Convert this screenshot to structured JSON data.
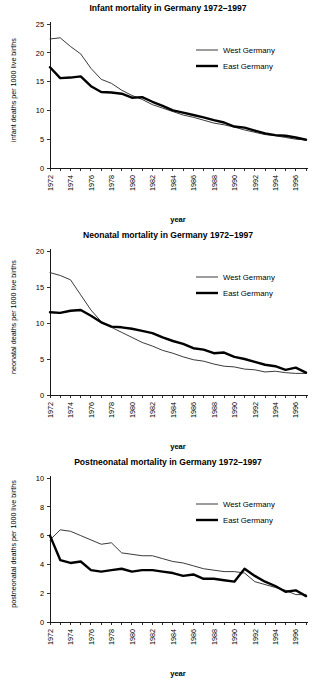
{
  "figure": {
    "panel_count": 3,
    "xlabel": "year",
    "legend": {
      "west_label": "West Germany",
      "east_label": "East Germany",
      "west_color": "#3a3a3a",
      "east_color": "#000000"
    }
  },
  "chart_data": [
    {
      "type": "line",
      "title": "Infant mortality in Germany 1972–1997",
      "xlabel": "year",
      "ylabel": "infant deaths per 1000 live births",
      "ylim": [
        0,
        25
      ],
      "yticks": [
        0,
        5,
        10,
        15,
        20,
        25
      ],
      "xlim": [
        1972,
        1997
      ],
      "xticks": [
        1972,
        1973,
        1974,
        1975,
        1976,
        1977,
        1978,
        1979,
        1980,
        1981,
        1982,
        1983,
        1984,
        1985,
        1986,
        1987,
        1988,
        1989,
        1990,
        1991,
        1992,
        1993,
        1994,
        1995,
        1996,
        1997
      ],
      "xticklabels": [
        "1972",
        "",
        "1974",
        "",
        "1976",
        "",
        "1978",
        "",
        "1980",
        "",
        "1982",
        "",
        "1984",
        "",
        "1986",
        "",
        "1988",
        "",
        "1990",
        "",
        "1992",
        "",
        "1994",
        "",
        "1996",
        ""
      ],
      "grid": false,
      "legend_position": "upper right",
      "x": [
        1972,
        1973,
        1974,
        1975,
        1976,
        1977,
        1978,
        1979,
        1980,
        1981,
        1982,
        1983,
        1984,
        1985,
        1986,
        1987,
        1988,
        1989,
        1990,
        1991,
        1992,
        1993,
        1994,
        1995,
        1996,
        1997
      ],
      "series": [
        {
          "name": "West Germany",
          "values": [
            22.4,
            22.6,
            21.1,
            19.8,
            17.3,
            15.4,
            14.7,
            13.5,
            12.6,
            11.9,
            11.0,
            10.4,
            9.8,
            9.2,
            8.8,
            8.3,
            7.8,
            7.5,
            7.1,
            6.6,
            6.2,
            5.8,
            5.6,
            5.3,
            5.0,
            4.9
          ]
        },
        {
          "name": "East Germany",
          "values": [
            17.5,
            15.6,
            15.7,
            15.9,
            14.2,
            13.2,
            13.1,
            12.9,
            12.2,
            12.3,
            11.5,
            10.8,
            10.0,
            9.6,
            9.2,
            8.8,
            8.3,
            7.9,
            7.2,
            7.0,
            6.5,
            6.0,
            5.7,
            5.6,
            5.3,
            4.9
          ]
        }
      ]
    },
    {
      "type": "line",
      "title": "Neonatal mortality in Germany 1972–1997",
      "xlabel": "year",
      "ylabel": "neonatal deaths per 1000 live births",
      "ylim": [
        0,
        20
      ],
      "yticks": [
        0,
        5,
        10,
        15,
        20
      ],
      "xlim": [
        1972,
        1997
      ],
      "xticks": [
        1972,
        1973,
        1974,
        1975,
        1976,
        1977,
        1978,
        1979,
        1980,
        1981,
        1982,
        1983,
        1984,
        1985,
        1986,
        1987,
        1988,
        1989,
        1990,
        1991,
        1992,
        1993,
        1994,
        1995,
        1996,
        1997
      ],
      "xticklabels": [
        "1972",
        "",
        "1974",
        "",
        "1976",
        "",
        "1978",
        "",
        "1980",
        "",
        "1982",
        "",
        "1984",
        "",
        "1986",
        "",
        "1988",
        "",
        "1990",
        "",
        "1992",
        "",
        "1994",
        "",
        "1996",
        ""
      ],
      "grid": false,
      "legend_position": "upper right",
      "x": [
        1972,
        1973,
        1974,
        1975,
        1976,
        1977,
        1978,
        1979,
        1980,
        1981,
        1982,
        1983,
        1984,
        1985,
        1986,
        1987,
        1988,
        1989,
        1990,
        1991,
        1992,
        1993,
        1994,
        1995,
        1996,
        1997
      ],
      "series": [
        {
          "name": "West Germany",
          "values": [
            17.0,
            16.6,
            16.0,
            13.9,
            11.8,
            10.2,
            9.4,
            8.7,
            8.0,
            7.3,
            6.8,
            6.2,
            5.8,
            5.3,
            4.9,
            4.7,
            4.3,
            4.0,
            3.9,
            3.6,
            3.5,
            3.2,
            3.3,
            3.1,
            3.0,
            3.0
          ]
        },
        {
          "name": "East Germany",
          "values": [
            11.5,
            11.4,
            11.7,
            11.8,
            11.0,
            10.1,
            9.5,
            9.4,
            9.2,
            8.9,
            8.6,
            8.0,
            7.5,
            7.1,
            6.5,
            6.3,
            5.8,
            5.9,
            5.3,
            5.0,
            4.6,
            4.2,
            4.0,
            3.5,
            3.8,
            3.1
          ]
        }
      ]
    },
    {
      "type": "line",
      "title": "Postneonatal mortality in Germany 1972–1997",
      "xlabel": "year",
      "ylabel": "postneonatal deaths per 1000 live births",
      "ylim": [
        0,
        10
      ],
      "yticks": [
        0,
        2,
        4,
        6,
        8,
        10
      ],
      "xlim": [
        1972,
        1997
      ],
      "xticks": [
        1972,
        1973,
        1974,
        1975,
        1976,
        1977,
        1978,
        1979,
        1980,
        1981,
        1982,
        1983,
        1984,
        1985,
        1986,
        1987,
        1988,
        1989,
        1990,
        1991,
        1992,
        1993,
        1994,
        1995,
        1996,
        1997
      ],
      "xticklabels": [
        "1972",
        "",
        "1974",
        "",
        "1976",
        "",
        "1978",
        "",
        "1980",
        "",
        "1982",
        "",
        "1984",
        "",
        "1986",
        "",
        "1988",
        "",
        "1990",
        "",
        "1992",
        "",
        "1994",
        "",
        "1996",
        ""
      ],
      "grid": false,
      "legend_position": "upper right",
      "x": [
        1972,
        1973,
        1974,
        1975,
        1976,
        1977,
        1978,
        1979,
        1980,
        1981,
        1982,
        1983,
        1984,
        1985,
        1986,
        1987,
        1988,
        1989,
        1990,
        1991,
        1992,
        1993,
        1994,
        1995,
        1996,
        1997
      ],
      "series": [
        {
          "name": "West Germany",
          "values": [
            5.7,
            6.4,
            6.3,
            6.0,
            5.7,
            5.4,
            5.5,
            4.8,
            4.7,
            4.6,
            4.6,
            4.4,
            4.2,
            4.1,
            3.9,
            3.7,
            3.6,
            3.5,
            3.5,
            3.4,
            2.8,
            2.6,
            2.4,
            2.2,
            1.9,
            1.9
          ]
        },
        {
          "name": "East Germany",
          "values": [
            6.0,
            4.3,
            4.1,
            4.2,
            3.6,
            3.5,
            3.6,
            3.7,
            3.5,
            3.6,
            3.6,
            3.5,
            3.4,
            3.2,
            3.3,
            3.0,
            3.0,
            2.9,
            2.8,
            3.7,
            3.2,
            2.8,
            2.5,
            2.1,
            2.2,
            1.8
          ]
        }
      ]
    }
  ]
}
